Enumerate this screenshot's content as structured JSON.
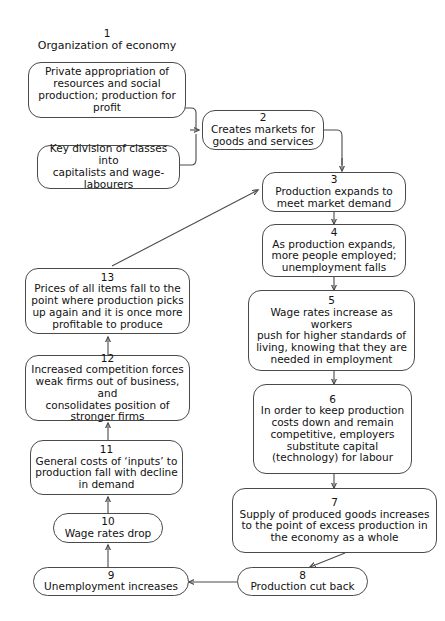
{
  "diagram": {
    "title": {
      "number": "1",
      "text": "Organization of economy"
    },
    "nodes": [
      {
        "id": "n1a",
        "number": "",
        "text": "Private appropriation of\nresources and social\nproduction; production for\nprofit"
      },
      {
        "id": "n1b",
        "number": "",
        "text": "Key division of classes into\ncapitalists and wage-\nlabourers"
      },
      {
        "id": "n2",
        "number": "2",
        "text": "Creates markets for\ngoods and services"
      },
      {
        "id": "n3",
        "number": "3",
        "text": "Production expands to\nmeet market demand"
      },
      {
        "id": "n4",
        "number": "4",
        "text": "As production expands,\nmore people employed;\nunemployment falls"
      },
      {
        "id": "n5",
        "number": "5",
        "text": "Wage rates increase as workers\npush for higher standards of\nliving, knowing that they are\nneeded in employment"
      },
      {
        "id": "n6",
        "number": "6",
        "text": "In order to keep production\ncosts down and remain\ncompetitive, employers\nsubstitute capital\n(technology) for labour"
      },
      {
        "id": "n7",
        "number": "7",
        "text": "Supply of produced goods increases\nto the point of excess production in\nthe economy as a whole"
      },
      {
        "id": "n8",
        "number": "8",
        "text": "Production cut back"
      },
      {
        "id": "n9",
        "number": "9",
        "text": "Unemployment increases"
      },
      {
        "id": "n10",
        "number": "10",
        "text": "Wage rates drop"
      },
      {
        "id": "n11",
        "number": "11",
        "text": "General costs of ‘inputs’ to\nproduction fall with decline\nin demand"
      },
      {
        "id": "n12",
        "number": "12",
        "text": "Increased competition forces\nweak firms out of business, and\nconsolidates position of\nstronger firms"
      },
      {
        "id": "n13",
        "number": "13",
        "text": "Prices of all items fall to the\npoint where production picks\nup again and it is once more\nprofitable to produce"
      }
    ],
    "colors": {
      "stroke": "#4a4a4a",
      "text": "#111111",
      "background": "#ffffff"
    }
  }
}
